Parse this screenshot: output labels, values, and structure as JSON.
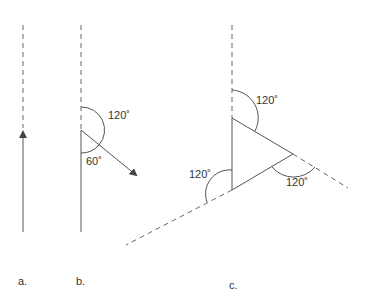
{
  "diagram": {
    "panels": [
      {
        "id": "a",
        "label": "a."
      },
      {
        "id": "b",
        "label": "b.",
        "angles": [
          "120˚",
          "60˚"
        ]
      },
      {
        "id": "c",
        "label": "c.",
        "angles": [
          "120˚",
          "120˚",
          "120˚"
        ]
      }
    ],
    "colors": {
      "line": "#555555",
      "text": "#333333"
    }
  }
}
